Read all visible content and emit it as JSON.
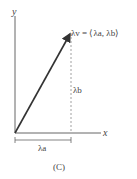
{
  "diagram": {
    "axes": {
      "x_label": "x",
      "y_label": "y"
    },
    "vector_label": "λv = ⟨λa, λb⟩",
    "vertical_component_label": "λb",
    "horizontal_component_label": "λa",
    "caption": "(C)",
    "colors": {
      "ink": "#333333",
      "dashed": "#888888"
    }
  }
}
